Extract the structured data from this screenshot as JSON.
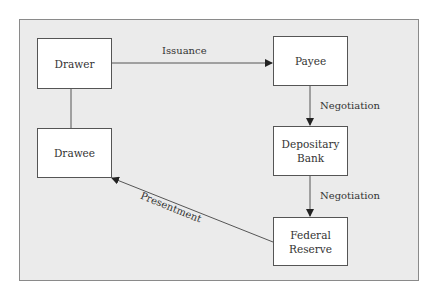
{
  "diagram": {
    "nodes": [
      {
        "id": "drawer",
        "label_lines": [
          "Drawer"
        ]
      },
      {
        "id": "payee",
        "label_lines": [
          "Payee"
        ]
      },
      {
        "id": "drawee",
        "label_lines": [
          "Drawee"
        ]
      },
      {
        "id": "depositary_bank",
        "label_lines": [
          "Depositary",
          "Bank"
        ]
      },
      {
        "id": "federal_reserve",
        "label_lines": [
          "Federal",
          "Reserve"
        ]
      }
    ],
    "edges": [
      {
        "from": "drawer",
        "to": "payee",
        "label": "Issuance",
        "arrow": true
      },
      {
        "from": "payee",
        "to": "depositary_bank",
        "label": "Negotiation",
        "arrow": true
      },
      {
        "from": "depositary_bank",
        "to": "federal_reserve",
        "label": "Negotiation",
        "arrow": true
      },
      {
        "from": "federal_reserve",
        "to": "drawee",
        "label": "Presentment",
        "arrow": true
      },
      {
        "from": "drawer",
        "to": "drawee",
        "label": "",
        "arrow": false
      }
    ],
    "colors": {
      "background": "#ebebeb",
      "box_fill": "#ffffff",
      "line": "#555555",
      "text": "#333333"
    }
  }
}
